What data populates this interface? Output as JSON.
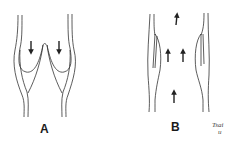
{
  "figure": {
    "panels": [
      {
        "id": "A",
        "label": "A",
        "description": "Closed venous valve: cusps meet centrally, arrows point downward (retrograde flow blocked)",
        "arrow_direction": "down",
        "arrow_count": 2
      },
      {
        "id": "B",
        "label": "B",
        "description": "Open venous valve: cusps flattened against vein wall, arrows point upward (forward flow)",
        "arrow_direction": "up",
        "arrow_count": 4
      }
    ],
    "signature": {
      "line1": "Tsai",
      "line2": "u"
    },
    "colors": {
      "stroke": "#333333",
      "background": "#ffffff"
    }
  }
}
